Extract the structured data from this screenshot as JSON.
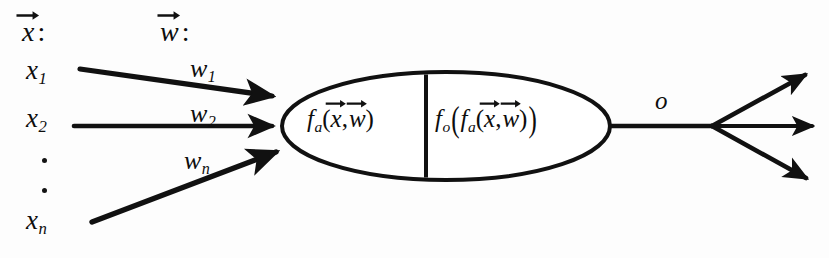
{
  "figure": {
    "ink_color": "#111111",
    "background_color": "#fdfdfd"
  },
  "headers": {
    "input_vector": {
      "symbol": "x",
      "accent": "vector-arrow",
      "colon": ":"
    },
    "weight_vector": {
      "symbol": "w",
      "accent": "vector-arrow",
      "colon": ":"
    }
  },
  "inputs": [
    {
      "base": "x",
      "subscript": "1"
    },
    {
      "base": "x",
      "subscript": "2"
    },
    {
      "base": "x",
      "subscript": "n"
    }
  ],
  "ellipsis": {
    "dots": 2
  },
  "weights": [
    {
      "base": "w",
      "subscript": "1"
    },
    {
      "base": "w",
      "subscript": "2"
    },
    {
      "base": "w",
      "subscript": "n"
    }
  ],
  "neuron": {
    "activation": {
      "function_base": "f",
      "function_subscript": "a",
      "open_paren": "(",
      "arg1": "x",
      "comma": ",",
      "arg2": "w",
      "close_paren": ")"
    },
    "output": {
      "outer_base": "f",
      "outer_subscript": "o",
      "outer_open_paren": "(",
      "inner_base": "f",
      "inner_subscript": "a",
      "inner_open_paren": "(",
      "arg1": "x",
      "comma": ",",
      "arg2": "w",
      "inner_close_paren": ")",
      "outer_close_paren": ")"
    }
  },
  "output": {
    "label": "o"
  }
}
